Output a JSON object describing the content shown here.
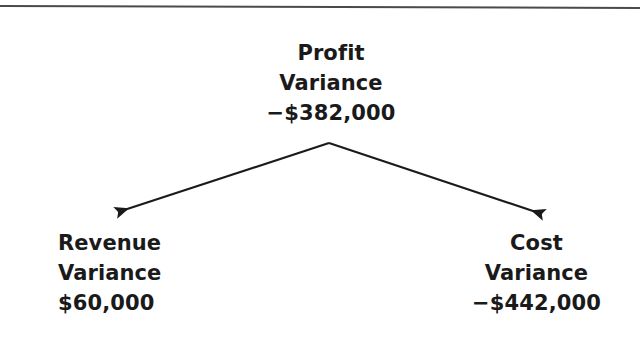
{
  "figure": {
    "background_color": "#ffffff",
    "ink_color": "#1a1a1a",
    "rule_color": "#4a4a4a"
  },
  "diagram": {
    "type": "variance-tree",
    "root": {
      "id": "profit-variance",
      "label_line_1": "Profit",
      "label_line_2": "Variance",
      "value": "−$382,000",
      "value_number": -382000,
      "sign": "negative"
    },
    "children": [
      {
        "id": "revenue-variance",
        "label_line_1": "Revenue",
        "label_line_2": "Variance",
        "value": "$60,000",
        "value_number": 60000,
        "sign": "positive",
        "position": "left"
      },
      {
        "id": "cost-variance",
        "label_line_1": "Cost",
        "label_line_2": "Variance",
        "value": "−$442,000",
        "value_number": -442000,
        "sign": "negative",
        "position": "right"
      }
    ],
    "connectors": [
      {
        "id": "arrow-to-revenue-variance",
        "from": "profit-variance",
        "to": "revenue-variance",
        "style": "solid-line-filled-arrowhead"
      },
      {
        "id": "arrow-to-cost-variance",
        "from": "profit-variance",
        "to": "cost-variance",
        "style": "solid-line-filled-arrowhead"
      }
    ]
  }
}
